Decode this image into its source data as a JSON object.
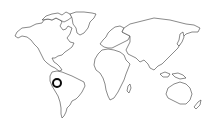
{
  "map": {
    "type": "world-outline",
    "background_color": "#ffffff",
    "outline_color": "#3a3a3a"
  },
  "marker": {
    "icon": "location-ring-icon",
    "region": "South America (Ecuador/Peru area)",
    "color": "#0a0a0a",
    "x": 58,
    "y": 84
  }
}
